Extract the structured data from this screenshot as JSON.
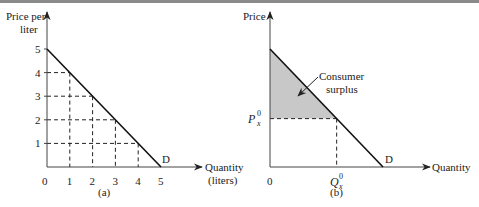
{
  "chart_data": [
    {
      "type": "line",
      "panel_label": "(a)",
      "ylabel": [
        "Price per",
        "liter"
      ],
      "xlabel": [
        "Quantity",
        "(liters)"
      ],
      "xlim": [
        0,
        5
      ],
      "ylim": [
        0,
        5
      ],
      "x_ticks": [
        "0",
        "1",
        "2",
        "3",
        "4",
        "5"
      ],
      "y_ticks": [
        "1",
        "2",
        "3",
        "4",
        "5"
      ],
      "curve_label": "D",
      "series": [
        {
          "name": "Demand",
          "x": [
            0,
            5
          ],
          "y": [
            5,
            0
          ]
        }
      ],
      "dashed_guides": [
        {
          "x": 1,
          "y": 4
        },
        {
          "x": 2,
          "y": 3
        },
        {
          "x": 3,
          "y": 2
        },
        {
          "x": 4,
          "y": 1
        }
      ]
    },
    {
      "type": "area",
      "panel_label": "(b)",
      "ylabel": [
        "Price"
      ],
      "xlabel": [
        "Quantity"
      ],
      "origin_label": "0",
      "curve_label": "D",
      "price_label": {
        "main": "P",
        "sub": "x",
        "sup": "0"
      },
      "quantity_label": {
        "main": "Q",
        "sub": "x",
        "sup": "0"
      },
      "annotation": [
        "Consumer",
        "surplus"
      ],
      "xlim": [
        0,
        1
      ],
      "ylim": [
        0,
        1
      ],
      "series": [
        {
          "name": "Demand",
          "x": [
            0,
            1
          ],
          "y": [
            1,
            0
          ]
        }
      ],
      "equilibrium": {
        "x": 0.59,
        "y": 0.41
      },
      "shaded_region": "consumer surplus above price, below demand",
      "shade_color": "#c8c8c8"
    }
  ]
}
